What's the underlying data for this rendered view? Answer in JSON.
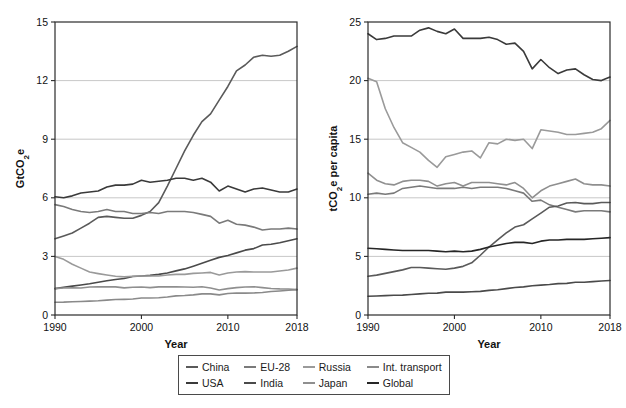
{
  "legend": {
    "rows": [
      [
        {
          "label": "China",
          "color": "#5a5a5a"
        },
        {
          "label": "EU-28",
          "color": "#7a7a7a"
        },
        {
          "label": "Russia",
          "color": "#9a9a9a"
        },
        {
          "label": "Int. transport",
          "color": "#8a8a8a"
        }
      ],
      [
        {
          "label": "USA",
          "color": "#3a3a3a"
        },
        {
          "label": "India",
          "color": "#4a4a4a"
        },
        {
          "label": "Japan",
          "color": "#8f8f8f"
        },
        {
          "label": "Global",
          "color": "#262626"
        }
      ]
    ]
  },
  "chart_data": [
    {
      "type": "line",
      "title": "",
      "xlabel": "Year",
      "ylabel": "GtCO2e",
      "ylabel_display": "GtCO₂e",
      "xlim": [
        1990,
        2018
      ],
      "ylim": [
        0,
        15
      ],
      "yticks": [
        0,
        3,
        6,
        9,
        12,
        15
      ],
      "xticks": [
        1990,
        2000,
        2010,
        2018
      ],
      "grid": "horizontal",
      "legend_position": "below-both-panels",
      "x": [
        1990,
        1991,
        1992,
        1993,
        1994,
        1995,
        1996,
        1997,
        1998,
        1999,
        2000,
        2001,
        2002,
        2003,
        2004,
        2005,
        2006,
        2007,
        2008,
        2009,
        2010,
        2011,
        2012,
        2013,
        2014,
        2015,
        2016,
        2017,
        2018
      ],
      "series": [
        {
          "name": "China",
          "color": "#5a5a5a",
          "values": [
            3.9,
            4.05,
            4.2,
            4.45,
            4.7,
            5.0,
            5.05,
            5.0,
            4.95,
            4.95,
            5.1,
            5.3,
            5.75,
            6.6,
            7.5,
            8.4,
            9.2,
            9.9,
            10.3,
            11.0,
            11.7,
            12.5,
            12.8,
            13.2,
            13.3,
            13.25,
            13.3,
            13.5,
            13.75
          ]
        },
        {
          "name": "USA",
          "color": "#3a3a3a",
          "values": [
            6.05,
            6.0,
            6.1,
            6.25,
            6.3,
            6.35,
            6.55,
            6.65,
            6.65,
            6.7,
            6.9,
            6.8,
            6.85,
            6.9,
            7.0,
            7.0,
            6.9,
            7.0,
            6.8,
            6.35,
            6.6,
            6.45,
            6.3,
            6.45,
            6.5,
            6.4,
            6.3,
            6.3,
            6.45
          ]
        },
        {
          "name": "EU-28",
          "color": "#7a7a7a",
          "values": [
            5.65,
            5.55,
            5.4,
            5.3,
            5.25,
            5.3,
            5.4,
            5.3,
            5.3,
            5.2,
            5.2,
            5.25,
            5.2,
            5.3,
            5.3,
            5.3,
            5.25,
            5.15,
            5.05,
            4.7,
            4.85,
            4.65,
            4.6,
            4.5,
            4.35,
            4.4,
            4.4,
            4.45,
            4.4
          ]
        },
        {
          "name": "India",
          "color": "#4a4a4a",
          "values": [
            1.35,
            1.42,
            1.48,
            1.54,
            1.6,
            1.68,
            1.75,
            1.82,
            1.87,
            1.97,
            2.0,
            2.03,
            2.08,
            2.15,
            2.26,
            2.36,
            2.5,
            2.65,
            2.8,
            2.95,
            3.05,
            3.18,
            3.32,
            3.4,
            3.58,
            3.62,
            3.7,
            3.8,
            3.9
          ]
        },
        {
          "name": "Russia",
          "color": "#9a9a9a",
          "values": [
            3.0,
            2.85,
            2.6,
            2.4,
            2.2,
            2.12,
            2.05,
            1.98,
            1.95,
            1.98,
            2.0,
            2.0,
            2.0,
            2.05,
            2.08,
            2.08,
            2.13,
            2.15,
            2.18,
            2.05,
            2.15,
            2.2,
            2.22,
            2.2,
            2.2,
            2.2,
            2.25,
            2.3,
            2.4
          ]
        },
        {
          "name": "Japan",
          "color": "#8f8f8f",
          "values": [
            1.35,
            1.38,
            1.39,
            1.38,
            1.43,
            1.44,
            1.45,
            1.44,
            1.39,
            1.42,
            1.43,
            1.4,
            1.44,
            1.45,
            1.44,
            1.43,
            1.42,
            1.45,
            1.38,
            1.28,
            1.35,
            1.4,
            1.43,
            1.45,
            1.4,
            1.36,
            1.34,
            1.33,
            1.3
          ]
        },
        {
          "name": "Int. transport",
          "color": "#8a8a8a",
          "values": [
            0.65,
            0.66,
            0.68,
            0.69,
            0.71,
            0.73,
            0.76,
            0.79,
            0.8,
            0.82,
            0.87,
            0.87,
            0.88,
            0.92,
            0.98,
            1.0,
            1.03,
            1.08,
            1.08,
            1.03,
            1.1,
            1.13,
            1.12,
            1.13,
            1.15,
            1.2,
            1.23,
            1.27,
            1.3
          ]
        }
      ]
    },
    {
      "type": "line",
      "title": "",
      "xlabel": "Year",
      "ylabel": "tCO2e per capita",
      "ylabel_display": "tCO₂e per capita",
      "xlim": [
        1990,
        2018
      ],
      "ylim": [
        0,
        25
      ],
      "yticks": [
        0,
        5,
        10,
        15,
        20,
        25
      ],
      "xticks": [
        1990,
        2000,
        2010,
        2018
      ],
      "grid": "horizontal",
      "legend_position": "below-both-panels",
      "x": [
        1990,
        1991,
        1992,
        1993,
        1994,
        1995,
        1996,
        1997,
        1998,
        1999,
        2000,
        2001,
        2002,
        2003,
        2004,
        2005,
        2006,
        2007,
        2008,
        2009,
        2010,
        2011,
        2012,
        2013,
        2014,
        2015,
        2016,
        2017,
        2018
      ],
      "series": [
        {
          "name": "USA",
          "color": "#3a3a3a",
          "values": [
            24.0,
            23.5,
            23.6,
            23.8,
            23.8,
            23.8,
            24.3,
            24.5,
            24.2,
            24.0,
            24.4,
            23.6,
            23.6,
            23.6,
            23.7,
            23.5,
            23.1,
            23.2,
            22.5,
            21.0,
            21.8,
            21.1,
            20.6,
            20.9,
            21.0,
            20.5,
            20.1,
            20.0,
            20.3
          ]
        },
        {
          "name": "Russia",
          "color": "#9a9a9a",
          "values": [
            20.2,
            19.9,
            17.6,
            16.0,
            14.7,
            14.3,
            13.9,
            13.2,
            12.6,
            13.5,
            13.7,
            13.9,
            14.0,
            13.4,
            14.7,
            14.6,
            15.0,
            14.9,
            15.0,
            14.2,
            15.8,
            15.7,
            15.6,
            15.4,
            15.4,
            15.5,
            15.6,
            15.9,
            16.6
          ]
        },
        {
          "name": "Japan",
          "color": "#8f8f8f",
          "values": [
            12.1,
            11.5,
            11.2,
            11.1,
            11.4,
            11.5,
            11.5,
            11.4,
            11.0,
            11.2,
            11.3,
            11.0,
            11.3,
            11.3,
            11.3,
            11.2,
            11.1,
            11.3,
            10.8,
            10.0,
            10.6,
            11.0,
            11.2,
            11.4,
            11.6,
            11.2,
            11.1,
            11.1,
            11.0
          ]
        },
        {
          "name": "EU-28",
          "color": "#7a7a7a",
          "values": [
            10.3,
            10.4,
            10.3,
            10.4,
            10.8,
            10.9,
            11.0,
            10.9,
            10.8,
            10.8,
            10.8,
            10.9,
            10.8,
            10.9,
            10.9,
            10.9,
            10.8,
            10.6,
            10.4,
            9.7,
            9.8,
            9.4,
            9.2,
            9.0,
            8.8,
            8.9,
            8.9,
            8.9,
            8.8
          ]
        },
        {
          "name": "China",
          "color": "#5a5a5a",
          "values": [
            3.3,
            3.4,
            3.55,
            3.7,
            3.85,
            4.05,
            4.05,
            4.0,
            3.95,
            3.9,
            4.0,
            4.15,
            4.45,
            5.1,
            5.8,
            6.4,
            7.0,
            7.5,
            7.7,
            8.2,
            8.7,
            9.2,
            9.3,
            9.55,
            9.6,
            9.5,
            9.5,
            9.6,
            9.6
          ]
        },
        {
          "name": "Global",
          "color": "#262626",
          "values": [
            5.7,
            5.65,
            5.6,
            5.55,
            5.5,
            5.5,
            5.5,
            5.5,
            5.45,
            5.4,
            5.45,
            5.4,
            5.45,
            5.6,
            5.8,
            5.95,
            6.1,
            6.2,
            6.2,
            6.1,
            6.3,
            6.4,
            6.4,
            6.45,
            6.45,
            6.45,
            6.5,
            6.55,
            6.6
          ]
        },
        {
          "name": "India",
          "color": "#4a4a4a",
          "values": [
            1.6,
            1.62,
            1.65,
            1.68,
            1.7,
            1.75,
            1.8,
            1.85,
            1.87,
            1.95,
            1.95,
            1.95,
            1.98,
            2.02,
            2.1,
            2.15,
            2.25,
            2.35,
            2.4,
            2.5,
            2.55,
            2.6,
            2.68,
            2.7,
            2.8,
            2.8,
            2.85,
            2.9,
            2.95
          ]
        }
      ]
    }
  ]
}
